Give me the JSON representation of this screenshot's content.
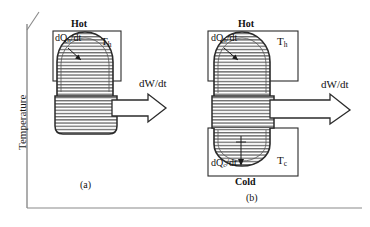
{
  "figure": {
    "axes": {
      "y_label": "Temperature",
      "x_label": "",
      "y_axis_name": "temperature-axis",
      "x_axis_name": "horizontal-axis"
    },
    "panels": [
      {
        "id": "a",
        "caption": "(a)",
        "type": "heat-engine-hot-only",
        "top_reservoir_label": "Hot",
        "bottom_reservoir_label": "",
        "heat_in_label": "dQ",
        "heat_in_sub": "h",
        "heat_in_suffix": "/dt",
        "heat_out_label": "",
        "heat_out_sub": "",
        "heat_out_suffix": "",
        "temp_hot_label": "T",
        "temp_hot_sub": "h",
        "temp_cold_label": "",
        "temp_cold_sub": "",
        "work_label": "dW/dt"
      },
      {
        "id": "b",
        "caption": "(b)",
        "type": "heat-engine-hot-and-cold",
        "top_reservoir_label": "Hot",
        "bottom_reservoir_label": "Cold",
        "heat_in_label": "dQ",
        "heat_in_sub": "h",
        "heat_in_suffix": "/dt",
        "heat_out_label": "dQ",
        "heat_out_sub": "c",
        "heat_out_suffix": "/dt",
        "temp_hot_label": "T",
        "temp_hot_sub": "h",
        "temp_cold_label": "T",
        "temp_cold_sub": "c",
        "work_label": "dW/dt"
      }
    ],
    "colors": {
      "line": "#2b2b2b",
      "hatch": "#3a3a3a",
      "background": "#ffffff",
      "axis": "#555555"
    }
  }
}
